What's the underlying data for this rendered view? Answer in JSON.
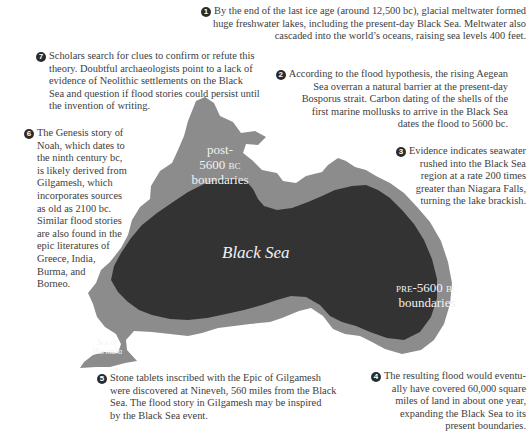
{
  "colors": {
    "background": "#ffffff",
    "post_boundary": "#8c8c8c",
    "pre_boundary": "#333333",
    "label_text": "#f2f2f2",
    "body_text": "#404040",
    "badge": "#2b2b2b"
  },
  "map": {
    "sea_label": "Black Sea",
    "post_label": [
      "post-",
      "5600 bc",
      "boundaries"
    ],
    "pre_label": [
      "pre-5600 bc",
      "boundaries"
    ],
    "marmara_label": [
      "Sea of",
      "Marmara"
    ]
  },
  "notes": [
    {
      "num": "1",
      "lines": [
        "By the end of the last ice age (around 12,500 bc), glacial meltwater formed",
        "huge freshwater lakes, including the present-day Black Sea. Meltwater also",
        "cascaded into the world’s oceans, raising sea levels 400 feet."
      ]
    },
    {
      "num": "2",
      "lines": [
        "According to the flood hypothesis, the rising Aegean",
        "Sea overran a natural barrier at the present-day",
        "Bosporus strait. Carbon dating of the shells of the",
        "first marine mollusks to arrive in the Black Sea",
        "dates the flood to 5600 bc."
      ]
    },
    {
      "num": "3",
      "lines": [
        "Evidence indicates seawater",
        "rushed into the Black Sea",
        "region at a rate 200 times",
        "greater than Niagara Falls,",
        "turning the lake brackish."
      ]
    },
    {
      "num": "4",
      "lines": [
        "The resulting flood would eventu-",
        "ally have covered 60,000 square",
        "miles of land in about one year,",
        "expanding the Black Sea to its",
        "present boundaries."
      ]
    },
    {
      "num": "5",
      "lines": [
        "Stone tablets inscribed with the Epic of Gilgamesh",
        "were discovered at Nineveh, 560 miles from the Black",
        "Sea. The flood story in Gilgamesh may be inspired",
        "by the Black Sea event."
      ]
    },
    {
      "num": "6",
      "lines": [
        "The Genesis story of",
        "Noah, which dates to",
        "the ninth century bc,",
        "is likely derived from",
        "Gilgamesh, which",
        "incorporates sources",
        "as old as 2100 bc.",
        "Similar flood stories",
        "are also found in the",
        "epic literatures of",
        "Greece, India,",
        "Burma, and",
        "Borneo."
      ]
    },
    {
      "num": "7",
      "lines": [
        "Scholars search for clues to confirm or refute this",
        "theory. Doubtful archaeologists point to a lack of",
        "evidence of Neolithic settlements on the Black",
        "Sea and question if flood stories could persist until",
        "the invention of writing."
      ]
    }
  ]
}
